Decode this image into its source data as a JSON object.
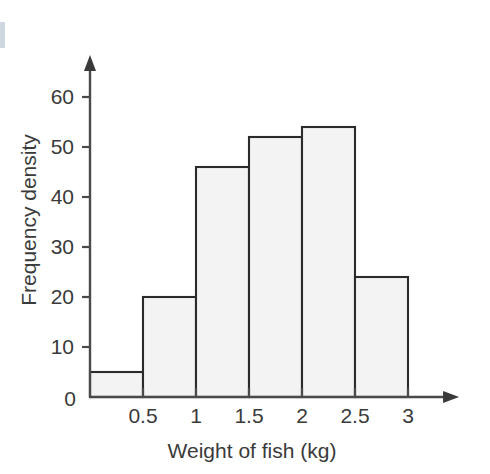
{
  "chart_data": {
    "type": "bar",
    "title": "",
    "subtitle": "",
    "xlabel": "Weight of fish (kg)",
    "ylabel": "Frequency density",
    "grid": false,
    "legend": "none",
    "bin_edges": [
      0,
      0.5,
      1,
      1.5,
      2,
      2.5,
      3
    ],
    "categories": [
      "0–0.5",
      "0.5–1",
      "1–1.5",
      "1.5–2",
      "2–2.5",
      "2.5–3"
    ],
    "values": [
      5,
      20,
      46,
      52,
      54,
      24
    ],
    "bars": [
      {
        "x0": 0,
        "x1": 0.5,
        "height": 5
      },
      {
        "x0": 0.5,
        "x1": 1,
        "height": 20
      },
      {
        "x0": 1,
        "x1": 1.5,
        "height": 46
      },
      {
        "x0": 1.5,
        "x1": 2,
        "height": 52
      },
      {
        "x0": 2,
        "x1": 2.5,
        "height": 54
      },
      {
        "x0": 2.5,
        "x1": 3,
        "height": 24
      }
    ],
    "xlim": [
      0,
      3.18
    ],
    "ylim": [
      0,
      66
    ],
    "xticks": [
      0.5,
      1,
      1.5,
      2,
      2.5,
      3
    ],
    "xtick_labels": [
      "0.5",
      "1",
      "1.5",
      "2",
      "2.5",
      "3"
    ],
    "yticks": [
      10,
      20,
      30,
      40,
      50,
      60
    ],
    "ytick_labels": [
      "10",
      "20",
      "30",
      "40",
      "50",
      "60"
    ],
    "origin_label": "0",
    "colors": {
      "bar_fill": "#f3f3f3",
      "bar_stroke": "#2b2b2b",
      "axis": "#4a4a4a",
      "text": "#3a3a3a",
      "background": "#ffffff",
      "margin_mark": "#cfd8e0"
    },
    "axis_arrows": {
      "x": "right-arrow",
      "y": "up-arrow"
    }
  },
  "axis_labels": {
    "y_axis_title": "Frequency density",
    "x_axis_title": "Weight of fish (kg)",
    "origin": "0",
    "y_ticks": [
      "10",
      "20",
      "30",
      "40",
      "50",
      "60"
    ],
    "x_ticks": [
      "0.5",
      "1",
      "1.5",
      "2",
      "2.5",
      "3"
    ]
  }
}
